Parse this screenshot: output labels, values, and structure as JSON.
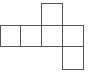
{
  "diagram": {
    "type": "cube-net",
    "stroke_color": "#555555",
    "background": "#ffffff",
    "squares": [
      {
        "id": "row-1",
        "x": 0,
        "y": 25,
        "w": 21,
        "h": 22
      },
      {
        "id": "row-2",
        "x": 20,
        "y": 25,
        "w": 22,
        "h": 22
      },
      {
        "id": "row-3",
        "x": 41,
        "y": 25,
        "w": 22,
        "h": 22
      },
      {
        "id": "row-4",
        "x": 62,
        "y": 25,
        "w": 22,
        "h": 22
      },
      {
        "id": "top",
        "x": 41,
        "y": 3,
        "w": 22,
        "h": 23
      },
      {
        "id": "bottom",
        "x": 62,
        "y": 46,
        "w": 22,
        "h": 24
      }
    ]
  }
}
